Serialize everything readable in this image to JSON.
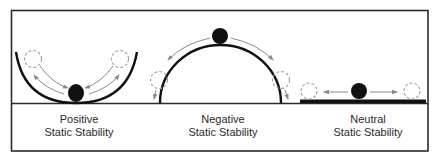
{
  "figure": {
    "colors": {
      "frame": "#2b2b2b",
      "surface": "#111111",
      "ball": "#111111",
      "arrow": "#8a8a8a",
      "dashed_ball": "#a0a0a0"
    },
    "panels": [
      {
        "id": "positive",
        "surface": "concave-bowl",
        "label_line1": "Positive",
        "label_line2": "Static Stability",
        "arrows": "toward-center"
      },
      {
        "id": "negative",
        "surface": "convex-dome",
        "label_line1": "Negative",
        "label_line2": "Static Stability",
        "arrows": "away-from-top"
      },
      {
        "id": "neutral",
        "surface": "flat",
        "label_line1": "Neutral",
        "label_line2": "Static Stability",
        "arrows": "horizontal-outward"
      }
    ]
  }
}
